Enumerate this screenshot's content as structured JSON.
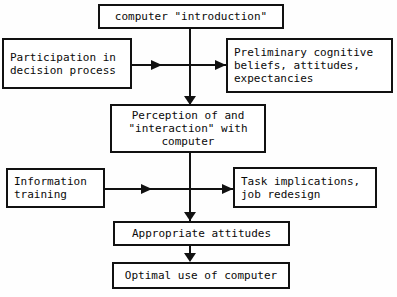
{
  "diagram": {
    "type": "flowchart",
    "nodes": [
      {
        "id": "computer-introduction",
        "label": "computer \"introduction\"",
        "x": 98,
        "y": 4,
        "w": 186,
        "h": 25,
        "align": "center"
      },
      {
        "id": "participation-decision-process",
        "label": "Participation in\ndecision process",
        "x": 2,
        "y": 38,
        "w": 130,
        "h": 51,
        "align": "left"
      },
      {
        "id": "preliminary-cognitive-beliefs",
        "label": "Preliminary cognitive\nbeliefs, attitudes,\nexpectancies",
        "x": 226,
        "y": 38,
        "w": 167,
        "h": 55,
        "align": "left"
      },
      {
        "id": "perception-interaction-computer",
        "label": "Perception of and\n\"interaction\" with\ncomputer",
        "x": 110,
        "y": 104,
        "w": 156,
        "h": 49,
        "align": "center"
      },
      {
        "id": "information-training",
        "label": "Information\ntraining",
        "x": 6,
        "y": 168,
        "w": 99,
        "h": 40,
        "align": "left"
      },
      {
        "id": "task-implications-job-redesign",
        "label": "Task implications,\njob redesign",
        "x": 233,
        "y": 167,
        "w": 144,
        "h": 41,
        "align": "left"
      },
      {
        "id": "appropriate-attitudes",
        "label": "Appropriate attitudes",
        "x": 113,
        "y": 221,
        "w": 177,
        "h": 25,
        "align": "center"
      },
      {
        "id": "optimal-use-of-computer",
        "label": "Optimal use of computer",
        "x": 112,
        "y": 262,
        "w": 178,
        "h": 27,
        "align": "center"
      }
    ],
    "colors": {
      "line": "#111111",
      "box_border": "#111111",
      "box_fill": "#ffffff",
      "text": "#0a0a0a",
      "page_background": "#fefefe"
    }
  }
}
